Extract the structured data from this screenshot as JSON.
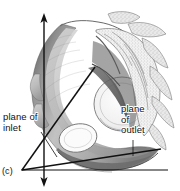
{
  "figure": {
    "panel_label": "(c)",
    "background_color": "#ffffff",
    "ink_color": "#111111"
  },
  "labels": {
    "inlet": "plane of\ninlet",
    "outlet": "plane\nof\noutlet"
  },
  "annotations": {
    "axis": {
      "name": "vertical-axis",
      "description": "vertical double-headed arrow",
      "x": 44,
      "y_top": 14,
      "y_bottom": 186
    },
    "inlet_plane_line": {
      "x1": 95,
      "y1": 68,
      "x2": 22,
      "y2": 170
    },
    "outlet_plane_line": {
      "x1": 22,
      "y1": 170,
      "x2": 160,
      "y2": 150
    },
    "baseline": {
      "x1": 22,
      "y1": 170,
      "x2": 168,
      "y2": 170
    },
    "inlet_leader": {
      "x1": 41,
      "y1": 133,
      "x2": 56,
      "y2": 156
    },
    "outlet_leader": {
      "x1": 133,
      "y1": 141,
      "x2": 133,
      "y2": 155
    }
  }
}
